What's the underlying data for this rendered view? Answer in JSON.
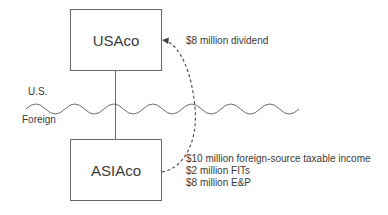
{
  "diagram": {
    "entities": {
      "parent": {
        "name": "USAco"
      },
      "subsidiary": {
        "name": "ASIAco"
      }
    },
    "border": {
      "upper_label": "U.S.",
      "lower_label": "Foreign"
    },
    "flow": {
      "dividend_label": "$8 million dividend",
      "direction": "ASIAco to USAco"
    },
    "subsidiary_notes": [
      "$10 million foreign-source taxable income",
      "$2 million FITs",
      "$8 million E&P"
    ],
    "colors": {
      "line": "#6a6a6a",
      "text": "#3a3a3a",
      "background": "#ffffff"
    }
  }
}
